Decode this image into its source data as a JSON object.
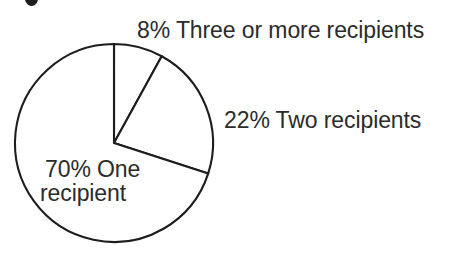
{
  "chart_data": {
    "type": "pie",
    "title": "",
    "categories": [
      "Three or more recipients",
      "Two recipients",
      "One recipient"
    ],
    "values": [
      8,
      22,
      70
    ],
    "unit": "percent",
    "labels": [
      "8% Three or more recipients",
      "22% Two recipients",
      "70% One recipient"
    ],
    "label_positions": [
      "top-outside",
      "right-outside",
      "inside-left"
    ],
    "start_angle_deg": 0,
    "direction": "clockwise",
    "legend": "none",
    "grid": false,
    "slice_fill": "#ffffff",
    "slice_stroke": "#1d1d1d",
    "geometry": {
      "center_x": 114,
      "center_y": 143,
      "radius": 99,
      "stroke_width": 2.1
    }
  },
  "figure": {
    "background_color": "#ffffff",
    "text_color": "#2b2b2b",
    "labels": {
      "three_or_more": "8% Three or more recipients",
      "two": "22% Two recipients",
      "one_line1": "70% One",
      "one_line2": "recipient"
    }
  }
}
